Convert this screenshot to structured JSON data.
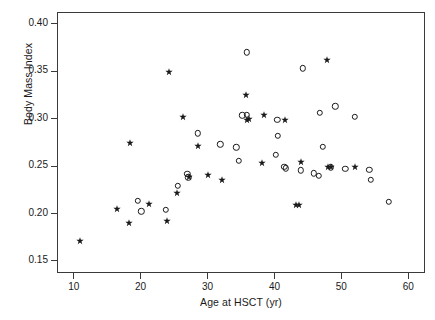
{
  "chart_data": {
    "type": "scatter",
    "title": "",
    "xlabel": "Age at HSCT (yr)",
    "ylabel": "Body Mass Index",
    "xlim": [
      7.5,
      62.5
    ],
    "ylim": [
      0.1375,
      0.4125
    ],
    "xticks": [
      10,
      20,
      30,
      40,
      50,
      60
    ],
    "xtick_labels": [
      "10",
      "20",
      "30",
      "40",
      "50",
      "60"
    ],
    "yticks": [
      0.15,
      0.2,
      0.25,
      0.3,
      0.35,
      0.4
    ],
    "ytick_labels": [
      "0.15",
      "0.20",
      "0.25",
      "0.30",
      "0.35",
      "0.40"
    ],
    "grid": false,
    "legend": null,
    "marker_color": "#1a1a1a",
    "axis_color": "#3a3a3a",
    "series": [
      {
        "name": "open-circle",
        "marker": "circle",
        "points": [
          [
            19.6,
            0.2135
          ],
          [
            20.1,
            0.2025
          ],
          [
            23.8,
            0.204
          ],
          [
            25.6,
            0.2295
          ],
          [
            27.0,
            0.242
          ],
          [
            27.1,
            0.2385
          ],
          [
            28.5,
            0.2845
          ],
          [
            31.9,
            0.273
          ],
          [
            34.3,
            0.27
          ],
          [
            34.7,
            0.2555
          ],
          [
            35.2,
            0.3035
          ],
          [
            35.9,
            0.304
          ],
          [
            35.9,
            0.37
          ],
          [
            40.2,
            0.262
          ],
          [
            40.4,
            0.299
          ],
          [
            40.5,
            0.282
          ],
          [
            41.5,
            0.2495
          ],
          [
            41.7,
            0.248
          ],
          [
            43.9,
            0.2455
          ],
          [
            44.2,
            0.353
          ],
          [
            45.9,
            0.2425
          ],
          [
            46.6,
            0.24
          ],
          [
            46.8,
            0.306
          ],
          [
            47.2,
            0.2705
          ],
          [
            48.4,
            0.249
          ],
          [
            49.1,
            0.313
          ],
          [
            50.6,
            0.2475
          ],
          [
            52.0,
            0.302
          ],
          [
            54.2,
            0.2465
          ],
          [
            54.4,
            0.236
          ],
          [
            57.1,
            0.2125
          ]
        ]
      },
      {
        "name": "star",
        "marker": "star",
        "points": [
          [
            10.9,
            0.1715
          ],
          [
            16.4,
            0.2045
          ],
          [
            18.3,
            0.1905
          ],
          [
            18.4,
            0.275
          ],
          [
            21.2,
            0.2105
          ],
          [
            23.9,
            0.1925
          ],
          [
            24.2,
            0.349
          ],
          [
            25.5,
            0.2215
          ],
          [
            26.3,
            0.302
          ],
          [
            27.2,
            0.239
          ],
          [
            28.5,
            0.2715
          ],
          [
            30.1,
            0.241
          ],
          [
            32.2,
            0.235
          ],
          [
            35.7,
            0.325
          ],
          [
            35.9,
            0.2985
          ],
          [
            36.2,
            0.2995
          ],
          [
            38.2,
            0.253
          ],
          [
            38.5,
            0.3045
          ],
          [
            41.6,
            0.2985
          ],
          [
            43.2,
            0.2095
          ],
          [
            43.7,
            0.209
          ],
          [
            44.0,
            0.2545
          ],
          [
            47.9,
            0.3615
          ],
          [
            48.0,
            0.249
          ],
          [
            48.5,
            0.249
          ],
          [
            52.1,
            0.249
          ]
        ]
      }
    ]
  }
}
